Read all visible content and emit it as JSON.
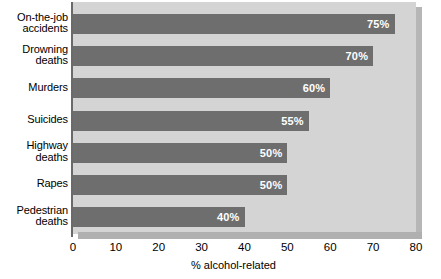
{
  "chart_data": {
    "type": "bar",
    "orientation": "horizontal",
    "title": "",
    "xlabel": "% alcohol-related",
    "ylabel": "",
    "xlim": [
      0,
      80
    ],
    "xticks": [
      0,
      10,
      20,
      30,
      40,
      50,
      60,
      70,
      80
    ],
    "xtick_labels": [
      "0",
      "10",
      "20",
      "30",
      "40",
      "50",
      "60",
      "70",
      "80"
    ],
    "grid": false,
    "legend": false,
    "categories": [
      "On-the-job accidents",
      "Drowning deaths",
      "Murders",
      "Suicides",
      "Highway deaths",
      "Rapes",
      "Pedestrian deaths"
    ],
    "category_lines": [
      [
        "On-the-job",
        "accidents"
      ],
      [
        "Drowning",
        "deaths"
      ],
      [
        "Murders"
      ],
      [
        "Suicides"
      ],
      [
        "Highway",
        "deaths"
      ],
      [
        "Rapes"
      ],
      [
        "Pedestrian",
        "deaths"
      ]
    ],
    "values": [
      75,
      70,
      60,
      55,
      50,
      50,
      40
    ],
    "data_labels": [
      "75%",
      "70%",
      "60%",
      "55%",
      "50%",
      "50%",
      "40%"
    ],
    "colors": {
      "bar": "#6e6e6e",
      "plot_background": "#d4d4d4",
      "panel_shadow": "#b6b6b6",
      "base_strip": "#b0b0b0",
      "axis_line": "#6a6a6a",
      "data_label_text": "#ffffff",
      "tick_text": "#000000",
      "page_background": "#ffffff"
    }
  }
}
